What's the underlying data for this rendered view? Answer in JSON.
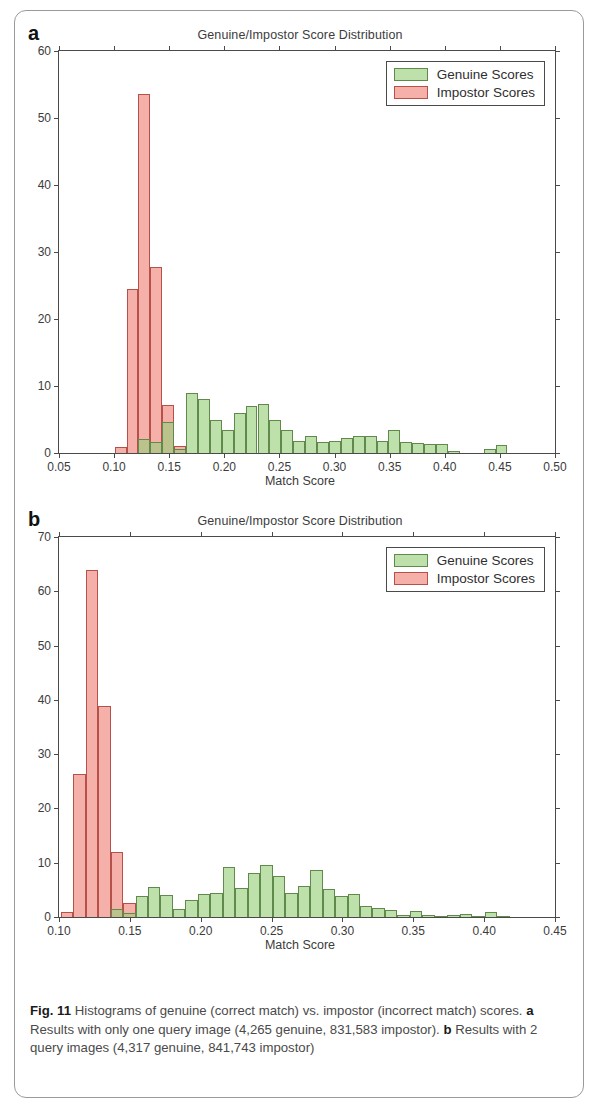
{
  "figure": {
    "label": "Fig. 11",
    "caption_text": "Histograms of genuine (correct match) vs. impostor (incorrect match) scores.",
    "panel_a_marker": "a",
    "panel_a_caption": "Results with only one query image (4,265 genuine, 831,583 impostor).",
    "panel_b_marker": "b",
    "panel_b_caption": "Results with 2 query images (4,317 genuine, 841,743 impostor)"
  },
  "legend": {
    "genuine_label": "Genuine Scores",
    "impostor_label": "Impostor Scores",
    "genuine_color": "#96cd78",
    "impostor_color": "#f08076"
  },
  "chart_data": [
    {
      "panel": "a",
      "type": "bar",
      "title": "Genuine/Impostor Score Distribution",
      "xlabel": "Match Score",
      "ylabel": "",
      "xlim": [
        0.05,
        0.5
      ],
      "ylim": [
        0,
        60
      ],
      "xticks": [
        "0.05",
        "0.10",
        "0.15",
        "0.20",
        "0.25",
        "0.30",
        "0.35",
        "0.40",
        "0.45",
        "0.50"
      ],
      "xtick_values": [
        0.05,
        0.1,
        0.15,
        0.2,
        0.25,
        0.3,
        0.35,
        0.4,
        0.45,
        0.5
      ],
      "yticks": [
        "0",
        "10",
        "20",
        "30",
        "40",
        "50",
        "60"
      ],
      "ytick_values": [
        0,
        10,
        20,
        30,
        40,
        50,
        60
      ],
      "grid": false,
      "legend_position": "top-right",
      "bin_width": 0.0108,
      "series": [
        {
          "name": "Impostor Scores",
          "color": "#f08076",
          "x": [
            0.1005,
            0.1113,
            0.1221,
            0.1329,
            0.1437,
            0.1545
          ],
          "values": [
            0.9,
            24.5,
            53.6,
            27.7,
            7.1,
            1.0
          ]
        },
        {
          "name": "Genuine Scores",
          "color": "#96cd78",
          "x": [
            0.1221,
            0.1329,
            0.1437,
            0.1545,
            0.1653,
            0.1761,
            0.1869,
            0.1977,
            0.2085,
            0.2193,
            0.2301,
            0.2409,
            0.2517,
            0.2625,
            0.2733,
            0.2841,
            0.2949,
            0.3057,
            0.3165,
            0.3273,
            0.3381,
            0.3489,
            0.3597,
            0.3705,
            0.3813,
            0.3921,
            0.4029,
            0.4353,
            0.4461
          ],
          "values": [
            2.1,
            1.6,
            4.6,
            0.6,
            8.9,
            8.0,
            4.9,
            3.4,
            6.0,
            7.0,
            7.3,
            5.0,
            3.4,
            1.8,
            2.6,
            1.7,
            1.8,
            2.2,
            2.6,
            2.5,
            1.8,
            3.4,
            1.7,
            1.5,
            1.3,
            1.3,
            0.3,
            0.6,
            1.2
          ]
        }
      ]
    },
    {
      "panel": "b",
      "type": "bar",
      "title": "Genuine/Impostor Score Distribution",
      "xlabel": "Match Score",
      "ylabel": "",
      "xlim": [
        0.1,
        0.45
      ],
      "ylim": [
        0,
        70
      ],
      "xticks": [
        "0.10",
        "0.15",
        "0.20",
        "0.25",
        "0.30",
        "0.35",
        "0.40",
        "0.45"
      ],
      "xtick_values": [
        0.1,
        0.15,
        0.2,
        0.25,
        0.3,
        0.35,
        0.4,
        0.45
      ],
      "yticks": [
        "0",
        "10",
        "20",
        "30",
        "40",
        "50",
        "60",
        "70"
      ],
      "ytick_values": [
        0,
        10,
        20,
        30,
        40,
        50,
        60,
        70
      ],
      "grid": false,
      "legend_position": "top-right",
      "bin_width": 0.0088,
      "series": [
        {
          "name": "Impostor Scores",
          "color": "#f08076",
          "x": [
            0.1012,
            0.11,
            0.1188,
            0.1276,
            0.1364,
            0.1452
          ],
          "values": [
            0.9,
            26.4,
            64.0,
            38.9,
            12.0,
            2.6
          ]
        },
        {
          "name": "Genuine Scores",
          "color": "#96cd78",
          "x": [
            0.1364,
            0.1452,
            0.154,
            0.1628,
            0.1716,
            0.1804,
            0.1892,
            0.198,
            0.2068,
            0.2156,
            0.2244,
            0.2332,
            0.242,
            0.2508,
            0.2596,
            0.2684,
            0.2772,
            0.286,
            0.2948,
            0.3036,
            0.3124,
            0.3212,
            0.33,
            0.3388,
            0.3476,
            0.3564,
            0.3652,
            0.374,
            0.3828,
            0.3916,
            0.4004,
            0.4092
          ],
          "values": [
            1.5,
            0.8,
            3.9,
            5.6,
            4.0,
            1.5,
            3.1,
            4.2,
            4.4,
            9.2,
            5.3,
            8.2,
            9.6,
            7.5,
            4.5,
            5.7,
            8.7,
            5.2,
            3.9,
            4.2,
            2.0,
            1.6,
            1.3,
            0.4,
            1.1,
            0.3,
            0.2,
            0.3,
            0.5,
            0.2,
            0.9,
            0.2
          ]
        }
      ]
    }
  ]
}
